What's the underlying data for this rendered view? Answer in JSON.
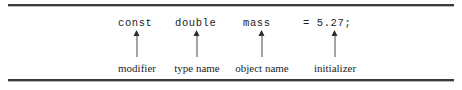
{
  "figure": {
    "type": "annotated-code-declaration",
    "background_color": "#ffffff",
    "rule_color": "#3a3a3a",
    "text_color": "#1d1d1d",
    "arrow_color": "#2b2b2b",
    "top_rule": "",
    "bottom_rule": ""
  },
  "code": {
    "full_line": "const double mass = 5.27;",
    "tokens": [
      {
        "text": "const",
        "x": 118
      },
      {
        "text": "double",
        "x": 175
      },
      {
        "text": "mass",
        "x": 243
      },
      {
        "text": "= 5.27;",
        "x": 303
      }
    ]
  },
  "annotations": [
    {
      "label": "modifier",
      "arrow_x": 137,
      "arrow_top": 30,
      "arrow_bottom": 57
    },
    {
      "label": "type name",
      "arrow_x": 197,
      "arrow_top": 30,
      "arrow_bottom": 57
    },
    {
      "label": "object name",
      "arrow_x": 262,
      "arrow_top": 30,
      "arrow_bottom": 57
    },
    {
      "label": "initializer",
      "arrow_x": 335,
      "arrow_top": 30,
      "arrow_bottom": 57
    }
  ]
}
